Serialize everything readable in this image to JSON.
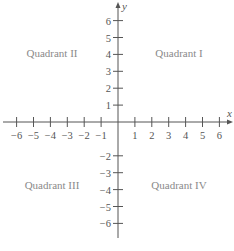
{
  "chart_data": {
    "type": "coordinate-plane",
    "title": "",
    "xlabel": "x",
    "ylabel": "y",
    "xlim": [
      -6,
      6
    ],
    "ylim": [
      -6,
      6
    ],
    "x_ticks": [
      -6,
      -5,
      -4,
      -3,
      -2,
      -1,
      1,
      2,
      3,
      4,
      5,
      6
    ],
    "y_ticks": [
      6,
      5,
      4,
      3,
      2,
      1,
      -2,
      -3,
      -4,
      -5,
      -6
    ],
    "grid": false,
    "quadrants": [
      {
        "name": "Quadrant I",
        "position": "upper-right"
      },
      {
        "name": "Quadrant II",
        "position": "upper-left"
      },
      {
        "name": "Quadrant III",
        "position": "lower-left"
      },
      {
        "name": "Quadrant IV",
        "position": "lower-right"
      }
    ]
  },
  "labels": {
    "x_axis": "x",
    "y_axis": "y",
    "q1": "Quadrant I",
    "q2": "Quadrant II",
    "q3": "Quadrant III",
    "q4": "Quadrant IV"
  },
  "colors": {
    "axis": "#555555",
    "quadrant_text": "#8a8a8a"
  }
}
